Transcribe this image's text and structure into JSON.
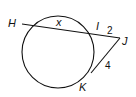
{
  "diagram": {
    "type": "circle-secant-tangent",
    "circle": {
      "cx": 58,
      "cy": 52,
      "r": 36
    },
    "points": {
      "H": {
        "label": "H",
        "x": 22,
        "y": 24
      },
      "I": {
        "label": "I",
        "x": 96,
        "y": 34
      },
      "J": {
        "label": "J",
        "x": 120,
        "y": 38
      },
      "K": {
        "label": "K",
        "x": 92,
        "y": 73
      }
    },
    "segments": {
      "HI": {
        "label": "x"
      },
      "IJ": {
        "label": "2"
      },
      "JK": {
        "label": "4"
      }
    },
    "stroke_color": "#111111"
  }
}
